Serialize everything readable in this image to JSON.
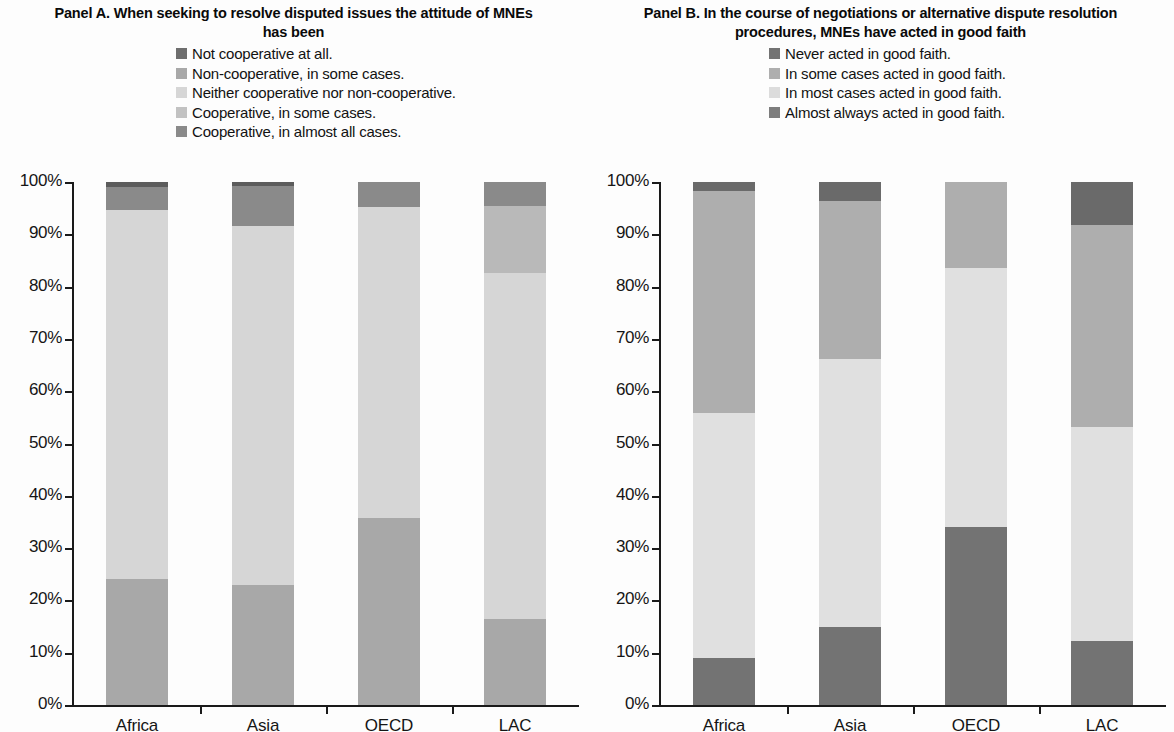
{
  "panels": [
    {
      "id": "panel-a",
      "title": "Panel A. When seeking to resolve disputed issues the attitude of MNEs has been",
      "legend": [
        {
          "label": "Not cooperative at all.",
          "color": "#6e6e6e"
        },
        {
          "label": "Non-cooperative, in some cases.",
          "color": "#a8a8a8"
        },
        {
          "label": "Neither cooperative nor non-cooperative.",
          "color": "#d6d6d6"
        },
        {
          "label": "Cooperative, in some cases.",
          "color": "#c2c2c2"
        },
        {
          "label": "Cooperative, in almost all cases.",
          "color": "#8a8a8a"
        }
      ]
    },
    {
      "id": "panel-b",
      "title": "Panel B. In the course of negotiations or alternative dispute resolution procedures, MNEs  have acted in good faith",
      "legend": [
        {
          "label": "Never acted in good faith.",
          "color": "#737373"
        },
        {
          "label": "In some cases acted in good faith.",
          "color": "#aeaeae"
        },
        {
          "label": "In most cases acted in good faith.",
          "color": "#dcdcdc"
        },
        {
          "label": "Almost always acted in good faith.",
          "color": "#7d7d7d"
        }
      ]
    }
  ],
  "chart_data": [
    {
      "type": "bar",
      "stacked": true,
      "title": "Panel A. When seeking to resolve disputed issues the attitude of MNEs has been",
      "xlabel": "",
      "ylabel": "",
      "ylim": [
        0,
        100
      ],
      "yticks": [
        "0%",
        "10%",
        "20%",
        "30%",
        "40%",
        "50%",
        "60%",
        "70%",
        "80%",
        "90%",
        "100%"
      ],
      "grid": false,
      "legend_position": "top",
      "categories": [
        "Africa",
        "Asia",
        "OECD",
        "LAC"
      ],
      "series": [
        {
          "name": "Not cooperative at all.",
          "color": "#6e6e6e",
          "values": [
            0,
            0,
            0,
            0
          ]
        },
        {
          "name": "Non-cooperative, in some cases.",
          "color": "#a8a8a8",
          "values": [
            24.1,
            22.9,
            35.8,
            16.4
          ]
        },
        {
          "name": "Neither cooperative nor non-cooperative.",
          "color": "#d6d6d6",
          "values": [
            70.5,
            68.6,
            59.4,
            66.2
          ]
        },
        {
          "name": "Cooperative, in some cases.",
          "color": "#b9b9b9",
          "values": [
            0.0,
            0.0,
            0.0,
            12.8
          ]
        },
        {
          "name": "Cooperative, in almost all cases.",
          "color": "#8a8a8a",
          "values": [
            4.5,
            7.8,
            4.8,
            4.6
          ]
        },
        {
          "name": "Top band",
          "color": "#5c5c5c",
          "values": [
            0.9,
            0.7,
            0.0,
            0.0
          ]
        }
      ]
    },
    {
      "type": "bar",
      "stacked": true,
      "title": "Panel B. In the course of negotiations or alternative dispute resolution procedures, MNEs  have acted in good faith",
      "xlabel": "",
      "ylabel": "",
      "ylim": [
        0,
        100
      ],
      "yticks": [
        "0%",
        "10%",
        "20%",
        "30%",
        "40%",
        "50%",
        "60%",
        "70%",
        "80%",
        "90%",
        "100%"
      ],
      "grid": false,
      "legend_position": "top",
      "categories": [
        "Africa",
        "Asia",
        "OECD",
        "LAC"
      ],
      "series": [
        {
          "name": "Never acted in good faith.",
          "color": "#737373",
          "values": [
            9.0,
            14.9,
            34.0,
            12.2
          ]
        },
        {
          "name": "In some cases acted in good faith.",
          "color": "#e0e0e0",
          "values": [
            46.8,
            51.3,
            49.6,
            41.0
          ]
        },
        {
          "name": "In most cases acted in good faith.",
          "color": "#aeaeae",
          "values": [
            42.5,
            30.2,
            16.4,
            38.6
          ]
        },
        {
          "name": "Almost always acted in good faith.",
          "color": "#6a6a6a",
          "values": [
            1.7,
            3.6,
            0.0,
            8.2
          ]
        }
      ]
    }
  ],
  "axis": {
    "yticks": [
      "100%",
      "90%",
      "80%",
      "70%",
      "60%",
      "50%",
      "40%",
      "30%",
      "20%",
      "10%",
      "0%"
    ],
    "xticks": [
      "Africa",
      "Asia",
      "OECD",
      "LAC"
    ]
  }
}
